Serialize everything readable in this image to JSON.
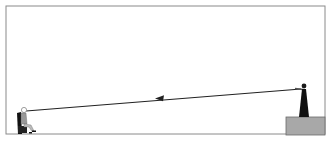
{
  "scene": {
    "frame": {
      "x": 6,
      "y": 6,
      "width": 319,
      "height": 128,
      "stroke": "#8a8a8a"
    },
    "platform": {
      "x": 286,
      "y": 117,
      "width": 39,
      "height": 18,
      "fill": "#a8a8a8",
      "stroke": "#6a6a6a"
    },
    "sight_line": {
      "from": [
        301,
        89
      ],
      "to": [
        24,
        111
      ],
      "color": "#222222"
    },
    "arrow": {
      "at": [
        160,
        98
      ],
      "direction": "left",
      "color": "#222222"
    },
    "observer_standing": {
      "position": "on-platform",
      "color": "#1a1a1a"
    },
    "observer_seated": {
      "position": "ground-left",
      "color": "#1a1a1a"
    }
  }
}
